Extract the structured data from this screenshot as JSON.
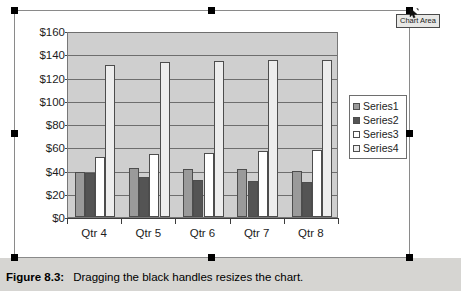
{
  "tooltip": {
    "label": "Chart Area"
  },
  "caption": {
    "figure_number": "Figure 8.3:",
    "text": "Dragging the black handles resizes the chart."
  },
  "chart_data": {
    "type": "bar",
    "title": "",
    "xlabel": "",
    "ylabel": "",
    "ylim": [
      0,
      160
    ],
    "ytick_step": 20,
    "ytick_labels": [
      "$0",
      "$20",
      "$40",
      "$60",
      "$80",
      "$100",
      "$120",
      "$140",
      "$160"
    ],
    "grid": true,
    "legend_position": "right",
    "categories": [
      "Qtr 4",
      "Qtr 5",
      "Qtr 6",
      "Qtr 7",
      "Qtr 8"
    ],
    "series": [
      {
        "name": "Series1",
        "color": "#9a9a9a",
        "values": [
          39,
          42,
          41,
          41,
          40
        ]
      },
      {
        "name": "Series2",
        "color": "#545454",
        "values": [
          38,
          34,
          32,
          31,
          30
        ]
      },
      {
        "name": "Series3",
        "color": "#ffffff",
        "values": [
          52,
          54,
          55,
          57,
          58
        ]
      },
      {
        "name": "Series4",
        "color": "#ededed",
        "values": [
          131,
          133,
          134,
          135,
          135
        ]
      }
    ]
  },
  "selection": {
    "handle_count": 8,
    "handle_color": "#000000"
  }
}
